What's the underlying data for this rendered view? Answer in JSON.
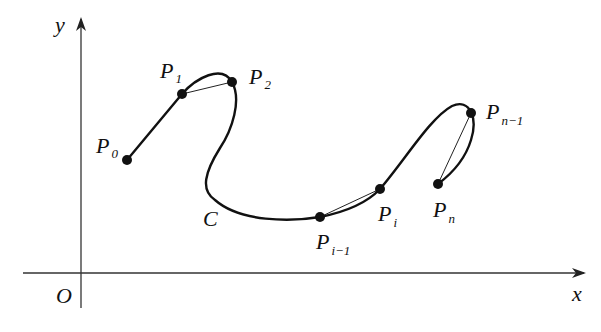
{
  "diagram": {
    "type": "curve-approximation-by-polyline",
    "axes": {
      "x_label": "x",
      "y_label": "y",
      "origin_label": "O"
    },
    "curve_label": "C",
    "points": [
      {
        "id": "P0",
        "base": "P",
        "sub": "0"
      },
      {
        "id": "P1",
        "base": "P",
        "sub": "1"
      },
      {
        "id": "P2",
        "base": "P",
        "sub": "2"
      },
      {
        "id": "Pi-1",
        "base": "P",
        "sub": "i−1"
      },
      {
        "id": "Pi",
        "base": "P",
        "sub": "i"
      },
      {
        "id": "Pn-1",
        "base": "P",
        "sub": "n−1"
      },
      {
        "id": "Pn",
        "base": "P",
        "sub": "n"
      }
    ],
    "chords": [
      "P1-P2",
      "Pi-1-Pi",
      "Pn-1-Pn"
    ],
    "colors": {
      "stroke": "#111111",
      "background": "#ffffff"
    }
  }
}
